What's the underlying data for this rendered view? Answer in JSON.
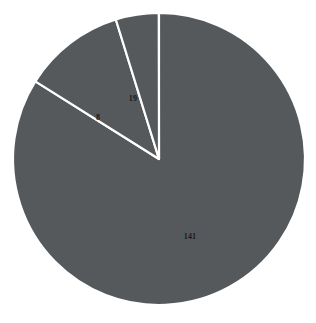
{
  "chart_data": {
    "type": "pie",
    "title": "",
    "xlabel": "",
    "ylabel": "",
    "categories": [
      "141",
      "19",
      "8"
    ],
    "values": [
      141,
      19,
      8
    ],
    "total": 168,
    "labels": [
      "141",
      "19",
      "8"
    ],
    "legend": [],
    "legend_position": "none",
    "grid": false,
    "start_angle_deg": 0,
    "direction": "clockwise",
    "slices": [
      {
        "label": "141",
        "value": 141,
        "percent": 83.9,
        "sweep_deg": 302.1,
        "color": "#55595b",
        "label_x": 190,
        "label_y": 237
      },
      {
        "label": "19",
        "value": 19,
        "percent": 11.3,
        "sweep_deg": 40.7,
        "color": "#55595b",
        "label_x": 133,
        "label_y": 99
      },
      {
        "label": "8",
        "value": 8,
        "percent": 4.8,
        "sweep_deg": 17.1,
        "color": "#55595b",
        "label_x": 98,
        "label_y": 118
      }
    ],
    "style": {
      "slice_color": "#55595b",
      "edge_color": "#ffffff",
      "edge_width": 2.2,
      "background": "#ffffff",
      "label_color": "#1b1b1b",
      "center_x": 159,
      "center_y": 159,
      "radius": 146
    }
  }
}
